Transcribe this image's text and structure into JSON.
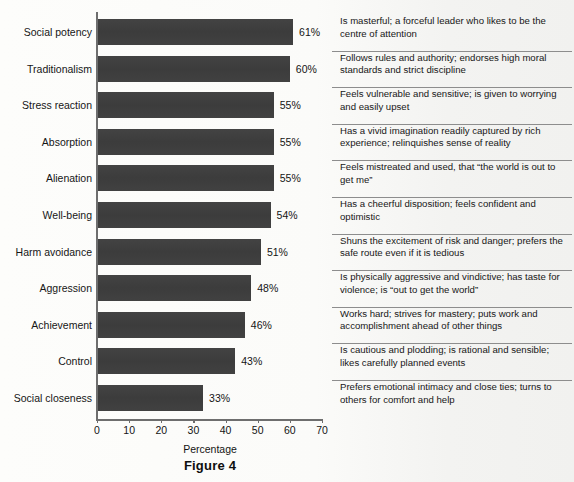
{
  "figure": {
    "caption": "Figure 4",
    "xlabel": "Percentage"
  },
  "axis": {
    "ticks": [
      {
        "label": "0",
        "value": 0
      },
      {
        "label": "10",
        "value": 10
      },
      {
        "label": "20",
        "value": 20
      },
      {
        "label": "30",
        "value": 30
      },
      {
        "label": "40",
        "value": 40
      },
      {
        "label": "50",
        "value": 50
      },
      {
        "label": "60",
        "value": 60
      },
      {
        "label": "70",
        "value": 70
      }
    ],
    "xmin": 0,
    "xmax": 70
  },
  "colors": {
    "bar": "#3f3f3f",
    "axis": "#6e6e6e",
    "separator": "#8d8d8d",
    "page": "#fdfdfb",
    "text": "#161616"
  },
  "ghost_text": {
    "line1": "",
    "line2": "",
    "line3": "",
    "line4": ""
  },
  "chart_data": {
    "type": "bar",
    "orientation": "horizontal",
    "title": "Figure 4",
    "xlabel": "Percentage",
    "ylabel": "",
    "xlim": [
      0,
      70
    ],
    "grid": false,
    "legend": "none",
    "categories": [
      "Social potency",
      "Traditionalism",
      "Stress reaction",
      "Absorption",
      "Alienation",
      "Well-being",
      "Harm avoidance",
      "Aggression",
      "Achievement",
      "Control",
      "Social closeness"
    ],
    "values": [
      61,
      60,
      55,
      55,
      55,
      54,
      51,
      48,
      46,
      43,
      33
    ],
    "value_labels": [
      "61%",
      "60%",
      "55%",
      "55%",
      "55%",
      "54%",
      "51%",
      "48%",
      "46%",
      "43%",
      "33%"
    ],
    "descriptions": [
      "Is masterful; a forceful leader who likes to be the centre of attention",
      "Follows rules and authority; endorses high moral standards and strict discipline",
      "Feels vulnerable and sensitive; is given to worrying and easily upset",
      "Has a vivid imagination readily captured by rich experience; relinquishes sense of reality",
      "Feels mistreated and used, that “the world is out to get me”",
      "Has a cheerful disposition; feels confident and optimistic",
      "Shuns the excitement of risk and danger; prefers the safe route even if it is tedious",
      "Is physically aggressive and vindictive; has taste for violence; is “out to get the world”",
      "Works hard; strives for mastery; puts work and accomplishment ahead of other things",
      "Is cautious and plodding; is rational and sensible; likes carefully planned events",
      "Prefers emotional intimacy and close ties; turns to others for comfort and help"
    ]
  }
}
